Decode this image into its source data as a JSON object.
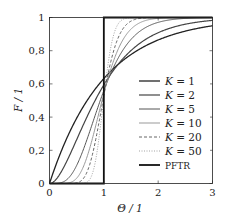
{
  "chart_data": {
    "type": "line",
    "title": "",
    "xlabel": "Θ / 1",
    "ylabel": "F / 1",
    "xlim": [
      0,
      3
    ],
    "ylim": [
      0,
      1
    ],
    "grid": false,
    "legend_position": "inside-right",
    "x_ticks": [
      "0",
      "1",
      "2",
      "3"
    ],
    "y_ticks": [
      "0",
      "0,2",
      "0,4",
      "0,6",
      "0,8",
      "1"
    ],
    "x_tick_values": [
      0,
      1,
      2,
      3
    ],
    "y_tick_values": [
      0,
      0.2,
      0.4,
      0.6,
      0.8,
      1
    ],
    "series": [
      {
        "name": "K = 1",
        "K": 1,
        "color": "#222222",
        "dash": "",
        "width": 1.3,
        "x": [
          0,
          0.5,
          1,
          1.5,
          2,
          2.5,
          3
        ],
        "values": [
          0,
          0.39,
          0.63,
          0.78,
          0.86,
          0.92,
          0.95
        ]
      },
      {
        "name": "K = 2",
        "K": 2,
        "color": "#444444",
        "dash": "",
        "width": 1.2,
        "x": [
          0,
          0.5,
          1,
          1.5,
          2,
          2.5,
          3
        ],
        "values": [
          0,
          0.26,
          0.59,
          0.8,
          0.91,
          0.96,
          0.98
        ]
      },
      {
        "name": "K = 5",
        "K": 5,
        "color": "#555555",
        "dash": "",
        "width": 1.0,
        "x": [
          0,
          0.5,
          1,
          1.5,
          2,
          2.5,
          3
        ],
        "values": [
          0,
          0.11,
          0.56,
          0.87,
          0.97,
          0.99,
          1.0
        ]
      },
      {
        "name": "K = 10",
        "K": 10,
        "color": "#999999",
        "dash": "",
        "width": 1.0,
        "x": [
          0,
          0.5,
          1,
          1.5,
          2,
          2.5,
          3
        ],
        "values": [
          0,
          0.03,
          0.54,
          0.93,
          1.0,
          1.0,
          1.0
        ]
      },
      {
        "name": "K = 20",
        "K": 20,
        "color": "#555555",
        "dash": "3,2",
        "width": 0.9,
        "x": [
          0,
          0.5,
          1,
          1.5,
          2,
          2.5,
          3
        ],
        "values": [
          0,
          0.0,
          0.53,
          0.98,
          1.0,
          1.0,
          1.0
        ]
      },
      {
        "name": "K = 50",
        "K": 50,
        "color": "#999999",
        "dash": "1,1.5",
        "width": 0.9,
        "x": [
          0,
          0.5,
          1,
          1.5,
          2,
          2.5,
          3
        ],
        "values": [
          0,
          0.0,
          0.52,
          1.0,
          1.0,
          1.0,
          1.0
        ]
      },
      {
        "name": "PFTR",
        "K": "inf",
        "color": "#111111",
        "dash": "",
        "width": 1.8,
        "x": [
          0,
          1,
          1,
          3
        ],
        "values": [
          0,
          0,
          1,
          1
        ]
      }
    ]
  },
  "legend": {
    "items": [
      {
        "label": "K = 1"
      },
      {
        "label": "K = 2"
      },
      {
        "label": "K = 5"
      },
      {
        "label": "K = 10"
      },
      {
        "label": "K = 20"
      },
      {
        "label": "K = 50"
      },
      {
        "label": "PFTR"
      }
    ]
  }
}
